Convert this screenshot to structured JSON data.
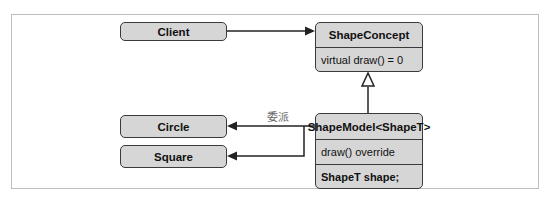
{
  "diagram": {
    "client": {
      "label": "Client"
    },
    "shape_concept": {
      "title": "ShapeConcept",
      "members": [
        "virtual draw() = 0"
      ]
    },
    "shape_model": {
      "title": "ShapeModel<ShapeT>",
      "members": [
        "draw() override",
        "ShapeT shape;"
      ]
    },
    "circle": {
      "label": "Circle"
    },
    "square": {
      "label": "Square"
    },
    "delegation_label": "委派",
    "colors": {
      "box_fill": "#d6d6d6",
      "border": "#3a3a3a",
      "line": "#222222",
      "frame": "#bdbdbd"
    }
  }
}
